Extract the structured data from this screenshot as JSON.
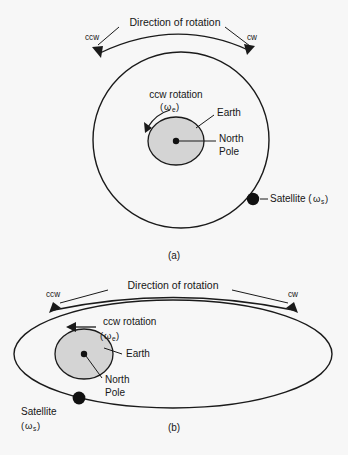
{
  "figure": {
    "background_color": "#f7f7f7",
    "line_color": "#1a1a1a",
    "earth_fill_color": "#d4d4d4",
    "satellite_color": "#111111"
  },
  "panel_a": {
    "caption": "(a)",
    "direction_label": "Direction of rotation",
    "ccw_label": "ccw",
    "cw_label": "cw",
    "rotation_label": "ccw rotation",
    "rotation_symbol_open": "(",
    "rotation_symbol_omega": "ω",
    "rotation_symbol_sub": "e",
    "rotation_symbol_close": ")",
    "earth_label": "Earth",
    "north_label": "North",
    "pole_label": "Pole",
    "satellite_label": "Satellite (",
    "satellite_omega": "ω",
    "satellite_sub": "s",
    "satellite_close": ")",
    "orbit_shape": "circle",
    "orbit_center_x": 181,
    "orbit_center_y": 140,
    "orbit_radius": 88,
    "earth_center_x": 176,
    "earth_center_y": 141,
    "earth_rx": 28,
    "earth_ry": 24,
    "satellite_x": 253,
    "satellite_y": 199
  },
  "panel_b": {
    "caption": "(b)",
    "direction_label": "Direction of rotation",
    "ccw_label": "ccw",
    "cw_label": "cw",
    "rotation_label": "ccw rotation",
    "rotation_symbol_open": "(",
    "rotation_symbol_omega": "ω",
    "rotation_symbol_sub": "e",
    "rotation_symbol_close": ")",
    "earth_label": "Earth",
    "north_label": "North",
    "pole_label": "Pole",
    "satellite_label": "Satellite",
    "satellite_symbol_open": "(",
    "satellite_omega": "ω",
    "satellite_sub": "s",
    "satellite_symbol_close": ")",
    "orbit_shape": "ellipse",
    "orbit_center_x": 173,
    "orbit_center_y": 354,
    "orbit_rx": 159,
    "orbit_ry": 54,
    "earth_center_x": 84,
    "earth_center_y": 354,
    "earth_rx": 29,
    "earth_ry": 25,
    "satellite_x": 79,
    "satellite_y": 398
  }
}
